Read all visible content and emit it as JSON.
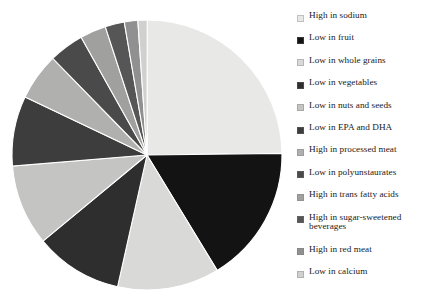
{
  "chart_data": {
    "type": "pie",
    "title": "",
    "subtitle": "",
    "xlabel": "",
    "ylabel": "",
    "grid": false,
    "legend_position": "right",
    "start_angle_deg": 90,
    "direction": "clockwise",
    "categories": [
      "High in sodium",
      "Low in fruit",
      "Low in whole grains",
      "Low in vegetables",
      "Low in nuts and seeds",
      "Low in EPA and DHA",
      "High in processed meat",
      "Low in polyunstaurates",
      "High in trans fatty acids",
      "High in sugar-sweetened beverages",
      "High in red meat",
      "Low in calcium"
    ],
    "values": [
      24.8,
      16.5,
      12.2,
      10.5,
      9.7,
      8.4,
      5.6,
      4.2,
      3.1,
      2.3,
      1.6,
      1.1
    ],
    "angles_deg": [
      89.3,
      59.4,
      43.9,
      37.8,
      34.9,
      30.2,
      20.2,
      15.1,
      11.2,
      8.3,
      5.8,
      4.0
    ],
    "colors": [
      "#e8e8e6",
      "#131313",
      "#d9d9d7",
      "#2e2e2e",
      "#c4c4c2",
      "#3d3d3d",
      "#b0b0ae",
      "#4a4a4a",
      "#a0a09e",
      "#565656",
      "#909090",
      "#d0d0ce"
    ]
  },
  "legend": {
    "items": [
      {
        "label": "High in sodium",
        "color": "#e8e8e6"
      },
      {
        "label": "Low in fruit",
        "color": "#131313"
      },
      {
        "label": "Low in whole grains",
        "color": "#d9d9d7"
      },
      {
        "label": "Low in vegetables",
        "color": "#2e2e2e"
      },
      {
        "label": "Low in nuts and seeds",
        "color": "#c4c4c2"
      },
      {
        "label": "Low in EPA and DHA",
        "color": "#3d3d3d"
      },
      {
        "label": "High in processed meat",
        "color": "#b0b0ae"
      },
      {
        "label": "Low in polyunstaurates",
        "color": "#4a4a4a"
      },
      {
        "label": "High in trans fatty acids",
        "color": "#a0a09e"
      },
      {
        "label": "High in sugar-sweetened beverages",
        "color": "#565656"
      },
      {
        "label": "High in red meat",
        "color": "#909090"
      },
      {
        "label": "Low in calcium",
        "color": "#d0d0ce"
      }
    ]
  }
}
